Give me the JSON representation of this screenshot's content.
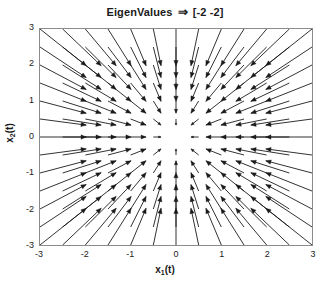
{
  "chart_data": {
    "type": "quiver",
    "title": "EigenValues ⇒ [-2 -2]",
    "title_parts": {
      "name": "EigenValues",
      "arrow": "⇒",
      "eigenvalues": "[-2 -2]"
    },
    "xlabel_main": "x",
    "xlabel_sub": "1",
    "xlabel_suffix": "(t)",
    "ylabel_main": "x",
    "ylabel_sub": "2",
    "ylabel_suffix": "(t)",
    "xlabel": "x_1(t)",
    "ylabel": "x_2(t)",
    "xlim": [
      -3,
      3
    ],
    "ylim": [
      -3,
      3
    ],
    "xticks": [
      -3,
      -2,
      -1,
      0,
      1,
      2,
      3
    ],
    "yticks": [
      3,
      2,
      1,
      0,
      -1,
      -2,
      -3
    ],
    "xtick_labels": [
      "-3",
      "-2",
      "-1",
      "0",
      "1",
      "2",
      "3"
    ],
    "ytick_labels": [
      "3",
      "2",
      "1",
      "0",
      "-1",
      "-2",
      "-3"
    ],
    "grid": false,
    "legend": null,
    "system": "dx/dt = A x, A = [[-2, 0], [0, -2]]",
    "eigenvalues": [
      -2,
      -2
    ],
    "field_type": "stable-node",
    "grid_step": 0.5,
    "grid_count": 13,
    "vector_scale": 0.34,
    "arrow_color": "#1a1a1a",
    "axis_color": "#8c8c8c",
    "background": "#ffffff"
  }
}
